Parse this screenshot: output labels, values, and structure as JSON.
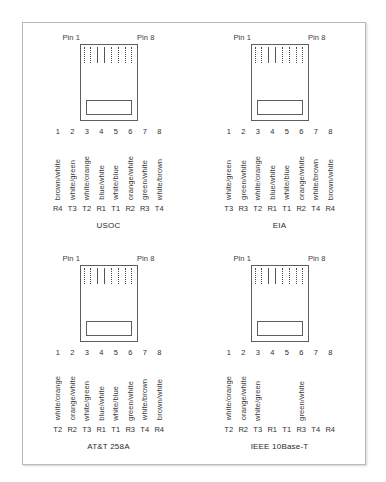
{
  "diagram": {
    "pin_header": {
      "first": "Pin 1",
      "last": "Pin 8"
    },
    "colors": {
      "frame_border": "#b9b9b9",
      "jack_outline": "#5d5d5d",
      "text": "#3a3a3a",
      "background": "#ffffff"
    },
    "standards": [
      {
        "name": "USOC",
        "pins": [
          {
            "number": "1",
            "wire": "brown/white",
            "pair": "R4"
          },
          {
            "number": "2",
            "wire": "white/green",
            "pair": "T3"
          },
          {
            "number": "3",
            "wire": "white/orange",
            "pair": "T2"
          },
          {
            "number": "4",
            "wire": "blue/white",
            "pair": "R1"
          },
          {
            "number": "5",
            "wire": "white/blue",
            "pair": "T1"
          },
          {
            "number": "6",
            "wire": "orange/white",
            "pair": "R2"
          },
          {
            "number": "7",
            "wire": "green/white",
            "pair": "R3"
          },
          {
            "number": "8",
            "wire": "white/brown",
            "pair": "T4"
          }
        ]
      },
      {
        "name": "EIA",
        "pins": [
          {
            "number": "1",
            "wire": "white/green",
            "pair": "T3"
          },
          {
            "number": "2",
            "wire": "green/white",
            "pair": "R3"
          },
          {
            "number": "3",
            "wire": "white/orange",
            "pair": "T2"
          },
          {
            "number": "4",
            "wire": "blue/white",
            "pair": "R1"
          },
          {
            "number": "5",
            "wire": "white/blue",
            "pair": "T1"
          },
          {
            "number": "6",
            "wire": "orange/white",
            "pair": "R2"
          },
          {
            "number": "7",
            "wire": "white/brown",
            "pair": "T4"
          },
          {
            "number": "8",
            "wire": "brown/white",
            "pair": "R4"
          }
        ]
      },
      {
        "name": "AT&T 258A",
        "pins": [
          {
            "number": "1",
            "wire": "white/orange",
            "pair": "T2"
          },
          {
            "number": "2",
            "wire": "orange/white",
            "pair": "R2"
          },
          {
            "number": "3",
            "wire": "white/green",
            "pair": "T3"
          },
          {
            "number": "4",
            "wire": "blue/white",
            "pair": "R1"
          },
          {
            "number": "5",
            "wire": "white/blue",
            "pair": "T1"
          },
          {
            "number": "6",
            "wire": "green/white",
            "pair": "R3"
          },
          {
            "number": "7",
            "wire": "white/brown",
            "pair": "T4"
          },
          {
            "number": "8",
            "wire": "brown/white",
            "pair": "R4"
          }
        ]
      },
      {
        "name": "IEEE 10Base-T",
        "pins": [
          {
            "number": "1",
            "wire": "white/orange",
            "pair": "T2"
          },
          {
            "number": "2",
            "wire": "orange/white",
            "pair": "R2"
          },
          {
            "number": "3",
            "wire": "white/green",
            "pair": "T3"
          },
          {
            "number": "4",
            "wire": "",
            "pair": "R1"
          },
          {
            "number": "5",
            "wire": "",
            "pair": "T1"
          },
          {
            "number": "6",
            "wire": "green/white",
            "pair": "R3"
          },
          {
            "number": "7",
            "wire": "",
            "pair": "T4"
          },
          {
            "number": "8",
            "wire": "",
            "pair": "R4"
          }
        ]
      }
    ]
  }
}
